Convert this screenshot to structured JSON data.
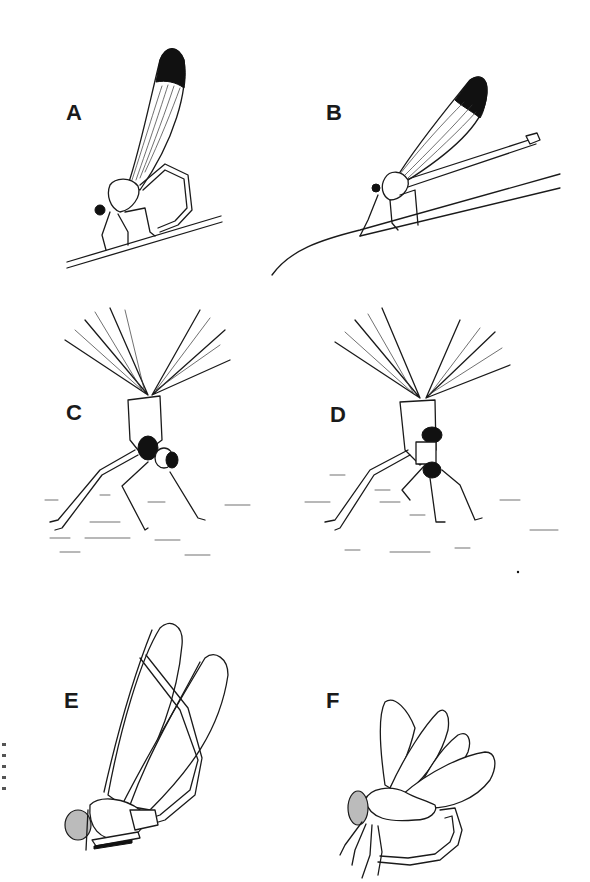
{
  "figure": {
    "type": "scientific illustration",
    "background_color": "#ffffff",
    "ink_color": "#1a1a1a",
    "panels": [
      {
        "id": "A",
        "label": "A",
        "description": "perched damselfly on stem, abdomen curled down, dark wing tip"
      },
      {
        "id": "B",
        "label": "B",
        "description": "perched damselfly on stem, abdomen straight, dark wing tip"
      },
      {
        "id": "C",
        "label": "C",
        "description": "damselfly on ground, front view, wings spread upward"
      },
      {
        "id": "D",
        "label": "D",
        "description": "damselfly on ground, front view, wings spread upward, variant"
      },
      {
        "id": "E",
        "label": "E",
        "description": "outline damselfly, abdomen curved up between wings"
      },
      {
        "id": "F",
        "label": "F",
        "description": "outline damselfly, abdomen curled under body"
      }
    ]
  }
}
